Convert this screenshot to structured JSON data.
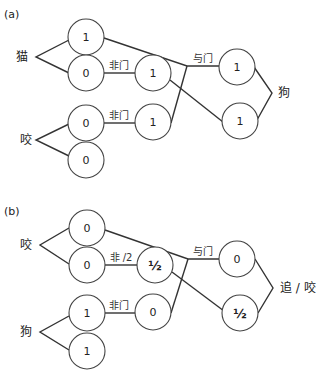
{
  "panels": [
    {
      "label": "(a)",
      "inputs": [
        {
          "word": "猫",
          "top_value": "1",
          "bottom_value": "0"
        },
        {
          "word": "咬",
          "top_value": "0",
          "bottom_value": "0"
        }
      ],
      "not_gates": [
        {
          "label": "非门",
          "output": "1"
        },
        {
          "label": "非门",
          "output": "1"
        }
      ],
      "and_gate": {
        "label": "与门"
      },
      "outputs": {
        "top_value": "1",
        "bottom_value": "1",
        "word": "狗"
      }
    },
    {
      "label": "(b)",
      "inputs": [
        {
          "word": "咬",
          "top_value": "0",
          "bottom_value": "0"
        },
        {
          "word": "狗",
          "top_value": "1",
          "bottom_value": "1"
        }
      ],
      "not_gates": [
        {
          "label": "非 /2",
          "output": "½"
        },
        {
          "label": "非门",
          "output": "0"
        }
      ],
      "and_gate": {
        "label": "与门"
      },
      "outputs": {
        "top_value": "0",
        "bottom_value": "½",
        "word": "追 / 咬"
      }
    }
  ]
}
